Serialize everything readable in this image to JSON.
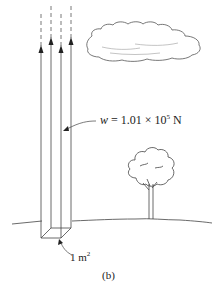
{
  "figure": {
    "caption": "(b)",
    "weight": {
      "symbol": "w",
      "equals": " = ",
      "mantissa": "1.01 × 10",
      "exponent": "5",
      "unit": " N"
    },
    "area": {
      "value": "1 m",
      "exponent": "2"
    },
    "elements": [
      "air-column",
      "upward-arrows",
      "cloud",
      "tree",
      "ground-line"
    ],
    "colors": {
      "line": "#333333",
      "background": "#ffffff"
    }
  }
}
